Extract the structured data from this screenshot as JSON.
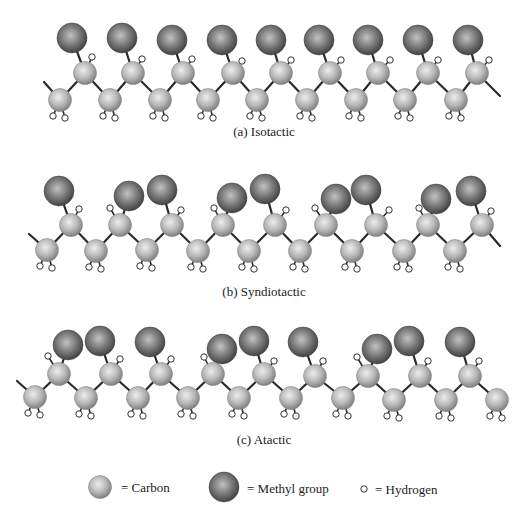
{
  "figure": {
    "panels": [
      {
        "id": "isotactic",
        "caption": "(a) Isotactic",
        "caption_pos": [
          264,
          132
        ],
        "start_tail": [
          44,
          82
        ],
        "end_tail": [
          500,
          96
        ],
        "lower": [
          [
            60,
            100
          ],
          [
            110,
            100
          ],
          [
            160,
            100
          ],
          [
            208,
            100
          ],
          [
            257,
            100
          ],
          [
            307,
            100
          ],
          [
            356,
            100
          ],
          [
            405,
            100
          ],
          [
            456,
            100
          ]
        ],
        "upper": [
          [
            85,
            73
          ],
          [
            133,
            73
          ],
          [
            183,
            73
          ],
          [
            233,
            73
          ],
          [
            281,
            73
          ],
          [
            330,
            73
          ],
          [
            378,
            73
          ],
          [
            428,
            73
          ],
          [
            477,
            73
          ]
        ],
        "methyl": [
          [
            72,
            38
          ],
          [
            122,
            38
          ],
          [
            172,
            40
          ],
          [
            222,
            40
          ],
          [
            271,
            40
          ],
          [
            319,
            40
          ],
          [
            368,
            40
          ],
          [
            418,
            40
          ],
          [
            468,
            40
          ]
        ],
        "upper_h": [
          [
            92,
            57
          ],
          [
            142,
            59
          ],
          [
            192,
            59
          ],
          [
            242,
            61
          ],
          [
            291,
            60
          ],
          [
            341,
            60
          ],
          [
            390,
            60
          ],
          [
            438,
            60
          ],
          [
            489,
            60
          ]
        ]
      },
      {
        "id": "syndiotactic",
        "caption": "(b) Syndiotactic",
        "caption_pos": [
          264,
          292
        ],
        "start_tail": [
          29,
          234
        ],
        "end_tail": [
          500,
          246
        ],
        "lower": [
          [
            47,
            250
          ],
          [
            96,
            251
          ],
          [
            147,
            250
          ],
          [
            198,
            251
          ],
          [
            249,
            251
          ],
          [
            300,
            251
          ],
          [
            352,
            251
          ],
          [
            404,
            251
          ],
          [
            455,
            251
          ]
        ],
        "upper": [
          [
            71,
            225
          ],
          [
            120,
            225
          ],
          [
            172,
            225
          ],
          [
            223,
            225
          ],
          [
            275,
            225
          ],
          [
            326,
            225
          ],
          [
            376,
            225
          ],
          [
            428,
            225
          ],
          [
            482,
            225
          ]
        ],
        "methyl": [
          [
            59,
            191
          ],
          [
            129,
            196
          ],
          [
            162,
            190
          ],
          [
            232,
            198
          ],
          [
            265,
            189
          ],
          [
            336,
            199
          ],
          [
            366,
            190
          ],
          [
            436,
            199
          ],
          [
            471,
            191
          ]
        ],
        "upper_h": [
          [
            79,
            209
          ],
          [
            110,
            208
          ],
          [
            181,
            210
          ],
          [
            214,
            208
          ],
          [
            286,
            210
          ],
          [
            315,
            208
          ],
          [
            389,
            210
          ],
          [
            419,
            208
          ],
          [
            491,
            211
          ]
        ]
      },
      {
        "id": "atactic",
        "caption": "(c) Atactic",
        "caption_pos": [
          264,
          440
        ],
        "start_tail": [
          17,
          381
        ],
        "end_tail": null,
        "lower": [
          [
            35,
            397
          ],
          [
            86,
            398
          ],
          [
            138,
            398
          ],
          [
            188,
            398
          ],
          [
            239,
            398
          ],
          [
            291,
            398
          ],
          [
            343,
            398
          ],
          [
            394,
            400
          ],
          [
            446,
            400
          ],
          [
            497,
            400
          ]
        ],
        "upper": [
          [
            59,
            374
          ],
          [
            111,
            374
          ],
          [
            161,
            374
          ],
          [
            213,
            374
          ],
          [
            264,
            374
          ],
          [
            315,
            376
          ],
          [
            368,
            376
          ],
          [
            420,
            376
          ],
          [
            470,
            376
          ]
        ],
        "methyl": [
          [
            68,
            345
          ],
          [
            100,
            341
          ],
          [
            150,
            342
          ],
          [
            222,
            349
          ],
          [
            254,
            341
          ],
          [
            303,
            342
          ],
          [
            377,
            349
          ],
          [
            409,
            341
          ],
          [
            460,
            342
          ]
        ],
        "upper_h": [
          [
            48,
            356
          ],
          [
            120,
            359
          ],
          [
            171,
            359
          ],
          [
            204,
            357
          ],
          [
            274,
            361
          ],
          [
            323,
            361
          ],
          [
            357,
            357
          ],
          [
            428,
            361
          ],
          [
            479,
            361
          ]
        ],
        "tail_lower": [
          [
            497,
            400
          ]
        ]
      }
    ],
    "legend": {
      "carbon_label": "= Carbon",
      "methyl_label": "= Methyl group",
      "hydrogen_label": "= Hydrogen"
    },
    "colors": {
      "carbon_light": "#e6e6e6",
      "carbon_mid": "#b4b4b4",
      "carbon_dark": "#7c7c7c",
      "methyl_light": "#bdbdbd",
      "methyl_mid": "#7a7a7a",
      "methyl_dark": "#3e3e3e",
      "bond": "#2a2a2a",
      "hydrogen_fill": "#ffffff",
      "hydrogen_stroke": "#333333"
    }
  }
}
